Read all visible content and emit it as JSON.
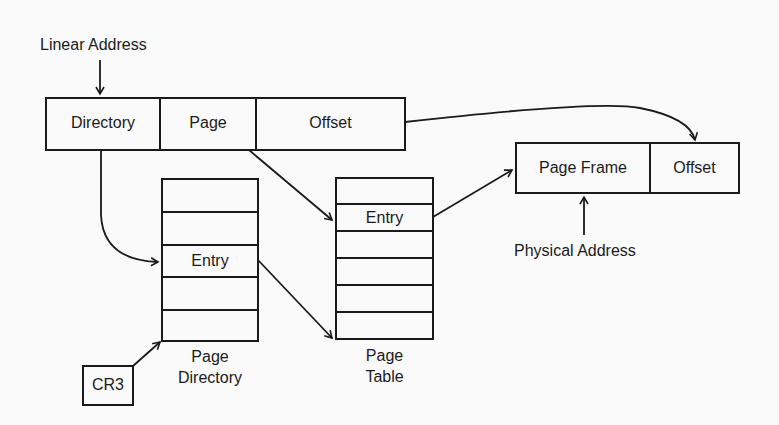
{
  "diagram": {
    "linear_address": {
      "label": "Linear Address",
      "fields": [
        "Directory",
        "Page",
        "Offset"
      ]
    },
    "page_directory": {
      "entry_label": "Entry",
      "caption_line1": "Page",
      "caption_line2": "Directory",
      "rows": 5
    },
    "page_table": {
      "entry_label": "Entry",
      "caption_line1": "Page",
      "caption_line2": "Table",
      "rows": 6
    },
    "physical_address": {
      "label": "Physical Address",
      "fields": [
        "Page Frame",
        "Offset"
      ]
    },
    "cr3": {
      "label": "CR3"
    }
  }
}
